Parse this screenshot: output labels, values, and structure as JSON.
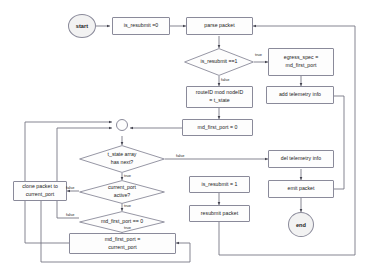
{
  "diagram": {
    "stroke_color": "#8a8a9a",
    "edge_color": "#555560",
    "text_color": "#1a1a1a",
    "terminator_fill": "#f2f2f2",
    "node_fill": "#fdfdfd"
  },
  "nodes": {
    "start": "start",
    "is_resubmit_init": "is_resubmit =0",
    "parse_packet": "parse packet",
    "is_resubmit_check": "is_resubmit ==1",
    "egress_spec": "egress_spec =\nmd_first_port",
    "egress_spec_line1": "egress_spec =",
    "egress_spec_line2": "md_first_port",
    "add_telemetry": "add telemetry info",
    "route_state_line1": "routeID mod nodeID",
    "route_state_line2": "= t_state",
    "md_first_port_zero": "md_first_port = 0",
    "junction": "",
    "t_state_array_line1": "t_state array",
    "t_state_array_line2": "has next?",
    "del_telemetry": "del telemetry info",
    "current_port_active_line1": "current_port",
    "current_port_active_line2": "active?",
    "clone_packet_line1": "clone packet to",
    "clone_packet_line2": "current_port",
    "is_resubmit_set": "is_resubmit = 1",
    "emit_packet": "emit packet",
    "md_first_port_check": "md_first_port == 0",
    "resubmit_packet": "resubmit packet",
    "md_first_port_assign_line1": "md_first_port =",
    "md_first_port_assign_line2": "current_port",
    "end": "end"
  },
  "edge_labels": {
    "resubmit_true": "true",
    "resubmit_false": "false",
    "array_false": "false",
    "array_true": "true",
    "active_true": "true",
    "active_false": "false",
    "first_port_true": "true",
    "first_port_false": "false"
  }
}
